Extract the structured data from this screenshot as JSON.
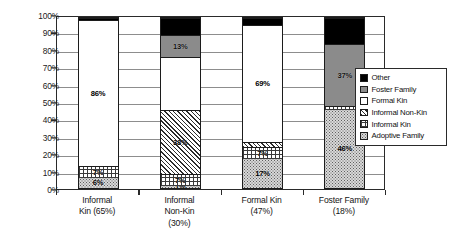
{
  "chart_data": {
    "type": "bar",
    "title": "",
    "subtitle": "",
    "xlabel": "",
    "ylabel": "",
    "stacked": true,
    "stack_mode": "percent",
    "grid": true,
    "legend_position": "right",
    "ylim": [
      0,
      100
    ],
    "ytick_labels": [
      "0%",
      "10%",
      "20%",
      "30%",
      "40%",
      "50%",
      "60%",
      "70%",
      "80%",
      "90%",
      "100%"
    ],
    "ytick_values": [
      0,
      10,
      20,
      30,
      40,
      50,
      60,
      70,
      80,
      90,
      100
    ],
    "categories": [
      "Informal\nKin (65%)",
      "Informal\nNon-Kin\n(30%)",
      "Formal Kin\n(47%)",
      "Foster Family\n(18%)"
    ],
    "category_lines": [
      [
        "Informal",
        "Kin (65%)"
      ],
      [
        "Informal",
        "Non-Kin",
        "(30%)"
      ],
      [
        "Formal Kin",
        "(47%)"
      ],
      [
        "Foster Family",
        "(18%)"
      ]
    ],
    "series": [
      {
        "name": "Adoptive Family",
        "pattern": "dotted",
        "values": [
          6,
          1,
          17,
          46
        ],
        "labels": [
          "6%",
          "1%",
          "17%",
          "46%"
        ],
        "show_label": [
          true,
          true,
          true,
          true
        ]
      },
      {
        "name": "Informal Kin",
        "pattern": "grid-hatch",
        "values": [
          7,
          7,
          7,
          2
        ],
        "labels": [
          "7%",
          "7%",
          "7%",
          ""
        ],
        "show_label": [
          true,
          true,
          true,
          false
        ]
      },
      {
        "name": "Informal Non-Kin",
        "pattern": "diagonal-hatch",
        "values": [
          0,
          38,
          3,
          0
        ],
        "labels": [
          "",
          "38%",
          "",
          ""
        ],
        "show_label": [
          false,
          true,
          false,
          false
        ]
      },
      {
        "name": "Formal Kin",
        "pattern": "solid-white",
        "values": [
          86,
          31,
          69,
          0
        ],
        "labels": [
          "86%",
          "",
          "69%",
          ""
        ],
        "show_label": [
          true,
          false,
          true,
          false
        ]
      },
      {
        "name": "Foster Family",
        "pattern": "solid-gray",
        "values": [
          0,
          13,
          0,
          37
        ],
        "labels": [
          "",
          "13%",
          "",
          "37%"
        ],
        "show_label": [
          false,
          true,
          false,
          true
        ]
      },
      {
        "name": "Other",
        "pattern": "solid-black",
        "values": [
          1,
          10,
          4,
          15
        ],
        "labels": [
          "",
          "",
          "",
          ""
        ],
        "show_label": [
          false,
          false,
          false,
          false
        ]
      }
    ]
  },
  "legend": {
    "items": [
      {
        "label": "Other",
        "pattern": "solid-black"
      },
      {
        "label": "Foster Family",
        "pattern": "solid-gray"
      },
      {
        "label": "Formal Kin",
        "pattern": "solid-white"
      },
      {
        "label": "Informal Non-Kin",
        "pattern": "diagonal-hatch"
      },
      {
        "label": "Informal Kin",
        "pattern": "grid-hatch"
      },
      {
        "label": "Adoptive Family",
        "pattern": "dotted"
      }
    ]
  }
}
